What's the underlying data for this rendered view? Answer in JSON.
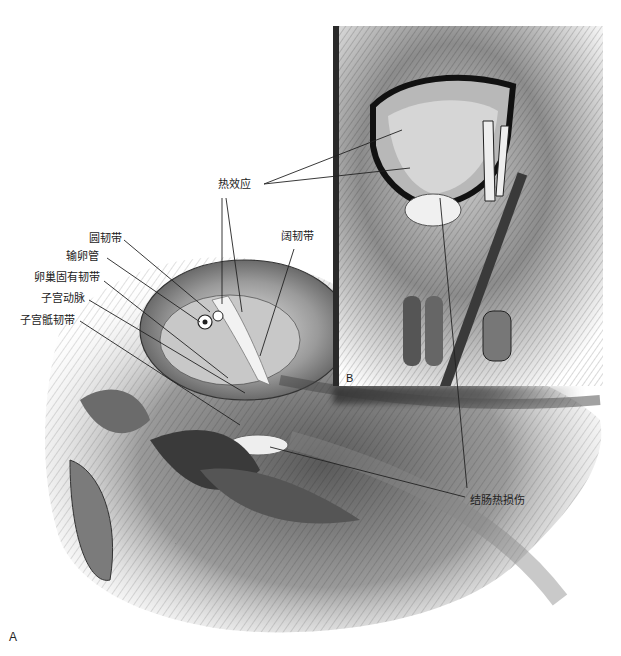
{
  "figure": {
    "panels": [
      "A",
      "B"
    ],
    "panel_A": {
      "letter": "A",
      "labels": {
        "round_ligament": "圆韧带",
        "fallopian_tube": "输卵管",
        "ovarian_ligament": "卵巢固有韧带",
        "uterine_artery": "子宫动脉",
        "uterosacral_ligament": "子宫骶韧带",
        "broad_ligament": "阔韧带",
        "thermal_effect": "热效应",
        "colon_thermal_injury": "结肠热损伤"
      }
    },
    "panel_B": {
      "letter": "B"
    },
    "colors": {
      "background": "#ffffff",
      "ink": "#222222",
      "tissue_mid": "#8a8a8a",
      "tissue_dark": "#2a2a2a"
    }
  }
}
